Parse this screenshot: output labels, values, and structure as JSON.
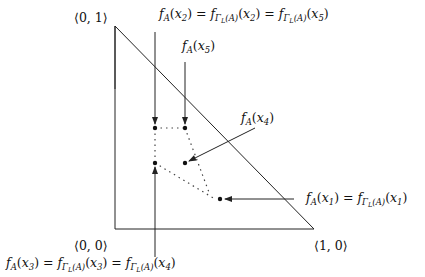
{
  "diagram": {
    "type": "triangle-point-map",
    "corners": {
      "top": "⟨0, 1⟩",
      "bottom_left": "⟨0, 0⟩",
      "bottom_right": "⟨1, 0⟩"
    },
    "labels": {
      "x2": "f_A(x_2) = f_{Γ_L(A)}(x_2) = f_{Γ_L(A)}(x_5)",
      "x5": "f_A(x_5)",
      "x4": "f_A(x_4)",
      "x1": "f_A(x_1) = f_{Γ_L(A)}(x_1)",
      "x3": "f_A(x_3) = f_{Γ_L(A)}(x_3) = f_{Γ_L(A)}(x_4)"
    },
    "points": [
      {
        "id": "x2",
        "x": 155,
        "y": 128
      },
      {
        "id": "x5",
        "x": 185,
        "y": 128
      },
      {
        "id": "x3",
        "x": 155,
        "y": 163
      },
      {
        "id": "x4",
        "x": 185,
        "y": 163
      },
      {
        "id": "x1",
        "x": 220,
        "y": 199
      }
    ],
    "colors": {
      "stroke": "#222222",
      "background": "#ffffff",
      "dotted": "#555555"
    }
  }
}
